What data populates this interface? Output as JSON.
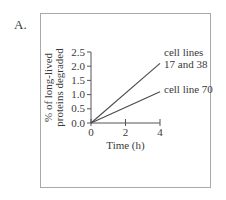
{
  "panel_label": "A.",
  "chart_data": {
    "type": "line",
    "title": "",
    "xlabel": "Time (h)",
    "ylabel": "% of long-lived proteins degraded",
    "ylabel_lines": [
      "% of long-lived",
      "proteins degraded"
    ],
    "xlim": [
      0,
      4
    ],
    "ylim": [
      0,
      2.5
    ],
    "x_ticks": [
      0,
      2,
      4
    ],
    "x_tick_labels": [
      "0",
      "2",
      "4"
    ],
    "y_ticks": [
      0.0,
      0.5,
      1.0,
      1.5,
      2.0,
      2.5
    ],
    "y_tick_labels": [
      "0.0",
      "0.5",
      "1.0",
      "1.5",
      "2.0",
      "2.5"
    ],
    "grid": false,
    "legend_position": "inline-right",
    "series": [
      {
        "name": "cell lines 17 and 38",
        "label_lines": [
          "cell lines",
          "17 and 38"
        ],
        "x": [
          0,
          4
        ],
        "y": [
          0.0,
          2.1
        ],
        "color": "#4a4a4a"
      },
      {
        "name": "cell line 70",
        "label_lines": [
          "cell line 70"
        ],
        "x": [
          0,
          4
        ],
        "y": [
          0.0,
          1.1
        ],
        "color": "#4a4a4a"
      }
    ]
  }
}
